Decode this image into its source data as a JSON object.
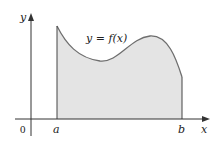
{
  "figure": {
    "curve_label": "y = f(x)",
    "x_axis_label": "x",
    "y_axis_label": "y",
    "origin_label": "0",
    "left_bound_label": "a",
    "right_bound_label": "b",
    "colors": {
      "fill": "#e4e4e4",
      "curve": "#6e6e6e",
      "axes": "#333333",
      "bounds": "#444444"
    }
  }
}
